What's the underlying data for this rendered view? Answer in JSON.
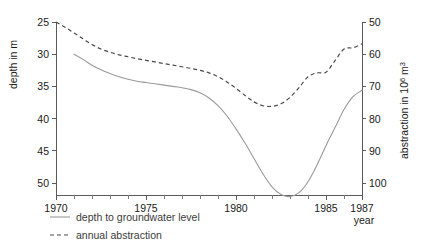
{
  "chart_data": {
    "type": "line",
    "title": "",
    "xlabel": "year",
    "xlim": [
      1970,
      1987
    ],
    "grid": false,
    "legend_position": "bottom-left",
    "x_ticks": [
      1970,
      1975,
      1980,
      1985,
      1987
    ],
    "x_tick_labels": [
      "1970",
      "1975",
      "1980",
      "1985",
      "1987"
    ],
    "x_minor_ticks": [
      1971,
      1972,
      1973,
      1974,
      1976,
      1977,
      1978,
      1979,
      1981,
      1982,
      1983,
      1984,
      1986
    ],
    "axes": [
      {
        "id": "left",
        "label": "depth in m",
        "ticks": [
          25,
          30,
          35,
          40,
          45,
          50
        ],
        "tick_labels": [
          "25",
          "30",
          "35",
          "40",
          "45",
          "50"
        ],
        "lim": [
          25,
          50
        ],
        "inverted": true
      },
      {
        "id": "right",
        "label": "abstraction in 10⁶ m³",
        "label_plain": "abstraction in 10",
        "label_exponent": "6",
        "label_unit": " m",
        "label_unit_exponent": "3",
        "ticks": [
          50,
          60,
          70,
          80,
          90,
          100
        ],
        "tick_labels": [
          "50",
          "60",
          "70",
          "80",
          "90",
          "100"
        ],
        "lim": [
          50,
          100
        ],
        "inverted": true
      }
    ],
    "series": [
      {
        "name": "depth to groundwater level",
        "style": "solid",
        "color": "#9a9a9a",
        "axis": "left",
        "unit": "m",
        "x": [
          1971.0,
          1971.5,
          1972.0,
          1972.5,
          1973.0,
          1973.5,
          1974.0,
          1974.5,
          1975.0,
          1975.5,
          1976.0,
          1976.5,
          1977.0,
          1977.5,
          1978.0,
          1978.5,
          1979.0,
          1979.5,
          1980.0,
          1980.5,
          1981.0,
          1981.5,
          1982.0,
          1982.5,
          1983.0,
          1983.5,
          1984.0,
          1984.5,
          1985.0,
          1985.5,
          1986.0,
          1986.5,
          1987.0
        ],
        "values": [
          30.0,
          30.8,
          31.7,
          32.4,
          33.0,
          33.5,
          33.9,
          34.2,
          34.4,
          34.6,
          34.8,
          35.0,
          35.2,
          35.5,
          36.0,
          36.8,
          38.0,
          39.6,
          41.6,
          43.8,
          46.2,
          48.6,
          50.6,
          51.8,
          52.1,
          51.5,
          49.8,
          47.2,
          44.2,
          41.4,
          38.6,
          36.6,
          35.6
        ]
      },
      {
        "name": "annual abstraction",
        "style": "dashed",
        "color": "#4a4a4a",
        "axis": "right",
        "unit": "10⁶ m³",
        "x": [
          1970.0,
          1970.5,
          1971.0,
          1971.5,
          1972.0,
          1972.5,
          1973.0,
          1973.5,
          1974.0,
          1974.5,
          1975.0,
          1975.5,
          1976.0,
          1976.5,
          1977.0,
          1977.5,
          1978.0,
          1978.5,
          1979.0,
          1979.5,
          1980.0,
          1980.5,
          1981.0,
          1981.5,
          1982.0,
          1982.5,
          1983.0,
          1983.5,
          1984.0,
          1984.5,
          1985.0,
          1985.5,
          1986.0,
          1986.5,
          1987.0
        ],
        "values": [
          50.0,
          51.6,
          53.4,
          55.2,
          57.0,
          58.4,
          59.4,
          60.2,
          60.8,
          61.4,
          61.9,
          62.4,
          62.9,
          63.4,
          63.9,
          64.4,
          65.0,
          65.8,
          67.0,
          68.6,
          70.6,
          72.8,
          74.8,
          76.0,
          76.2,
          75.4,
          73.4,
          70.4,
          67.0,
          65.8,
          65.6,
          62.0,
          58.4,
          58.0,
          56.8
        ]
      }
    ],
    "legend": [
      {
        "label": "depth to groundwater level",
        "style": "solid"
      },
      {
        "label": "annual abstraction",
        "style": "dashed"
      }
    ]
  }
}
